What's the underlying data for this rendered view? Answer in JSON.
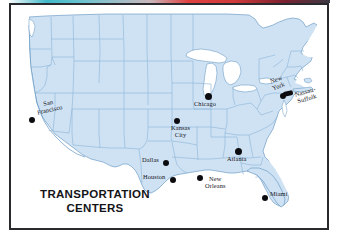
{
  "map": {
    "title_line1": "TRANSPORTATION",
    "title_line2": "CENTERS",
    "subject": "United States transportation centers map",
    "colors": {
      "land": "#cfe2f3",
      "water": "#ffffff",
      "state_border": "#8fb6d8",
      "coast_border": "#6f9dc6",
      "marker": "#0c0c10",
      "frame": "#2a2a2e",
      "label_text": "#14141a"
    },
    "cities": [
      {
        "name": "San Francisco",
        "label_line1": "San",
        "label_line2": "Francisco"
      },
      {
        "name": "Chicago",
        "label_line1": "Chicago",
        "label_line2": ""
      },
      {
        "name": "Kansas City",
        "label_line1": "Kansas",
        "label_line2": "City"
      },
      {
        "name": "New York",
        "label_line1": "New",
        "label_line2": "York"
      },
      {
        "name": "Nassau-Suffolk",
        "label_line1": "Nassau-",
        "label_line2": "Suffolk"
      },
      {
        "name": "Atlanta",
        "label_line1": "Atlanta",
        "label_line2": ""
      },
      {
        "name": "Dallas",
        "label_line1": "Dallas",
        "label_line2": ""
      },
      {
        "name": "Houston",
        "label_line1": "Houston",
        "label_line2": ""
      },
      {
        "name": "New Orleans",
        "label_line1": "New",
        "label_line2": "Orleans"
      },
      {
        "name": "Miami",
        "label_line1": "Miami",
        "label_line2": ""
      }
    ]
  }
}
